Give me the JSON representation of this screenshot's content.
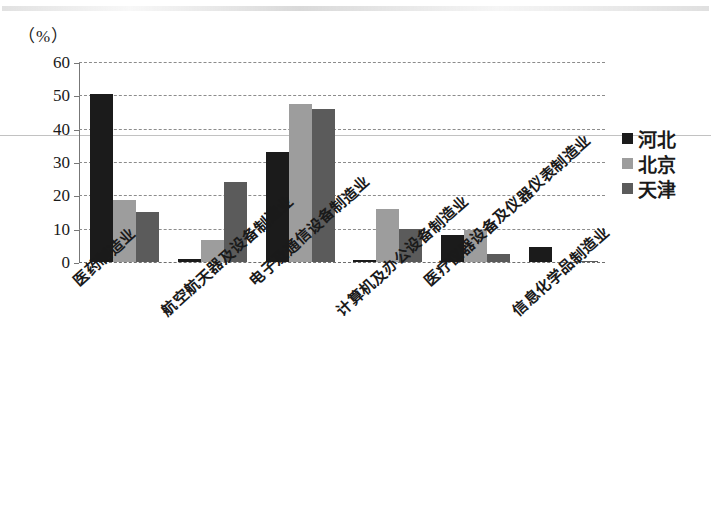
{
  "axis_unit_label": "（%）",
  "legend": {
    "position": "right",
    "items": [
      {
        "label": "河北",
        "color": "#1b1b1b",
        "swatch_name": "legend-swatch-hebei"
      },
      {
        "label": "北京",
        "color": "#9d9d9d",
        "swatch_name": "legend-swatch-beijing"
      },
      {
        "label": "天津",
        "color": "#5b5b5b",
        "swatch_name": "legend-swatch-tianjin"
      }
    ]
  },
  "y_axis": {
    "ticks": [
      "0",
      "10",
      "20",
      "30",
      "40",
      "50",
      "60"
    ],
    "min": 0,
    "max": 60,
    "step": 10
  },
  "chart_data": {
    "type": "bar",
    "title": "",
    "subtitle": "",
    "xlabel": "",
    "ylabel": "（%）",
    "ylim": [
      0,
      60
    ],
    "ytick_values": [
      0,
      10,
      20,
      30,
      40,
      50,
      60
    ],
    "grid": true,
    "grid_style": "dashed-horizontal",
    "legend_position": "right",
    "categories": [
      "医药制造业",
      "航空航天器及设备制造业",
      "电子及通信设备制造业",
      "计算机及办公设备制造业",
      "医疗仪器设备及仪器仪表制造业",
      "信息化学品制造业"
    ],
    "series": [
      {
        "name": "河北",
        "color": "#1b1b1b",
        "values": [
          50.5,
          1.0,
          33.0,
          0.5,
          8.0,
          4.5
        ]
      },
      {
        "name": "北京",
        "color": "#9d9d9d",
        "values": [
          18.5,
          6.5,
          47.5,
          16.0,
          9.5,
          0.0
        ]
      },
      {
        "name": "天津",
        "color": "#5b5b5b",
        "values": [
          15.0,
          24.0,
          46.0,
          10.0,
          2.5,
          0.4
        ]
      }
    ]
  }
}
